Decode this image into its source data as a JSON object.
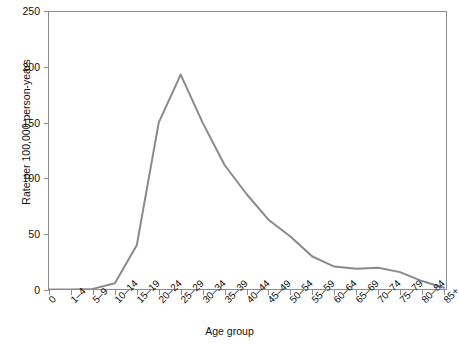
{
  "chart_data": {
    "type": "line",
    "title": "",
    "xlabel": "Age group",
    "ylabel": "Rate per 100,000 person-years",
    "categories": [
      "0",
      "1–4",
      "5–9",
      "10–14",
      "15–19",
      "20–24",
      "25–29",
      "30–34",
      "35–39",
      "40–44",
      "45–49",
      "50–54",
      "55–59",
      "60–64",
      "65–69",
      "70–74",
      "75–79",
      "80–84",
      "85+"
    ],
    "values": [
      0.5,
      0.5,
      1,
      6,
      40,
      150,
      193,
      150,
      112,
      86,
      63,
      48,
      30,
      21,
      19,
      20,
      16,
      8,
      2
    ],
    "series": [
      {
        "name": "Rate",
        "color": "#8a8a8a",
        "values": [
          0.5,
          0.5,
          1,
          6,
          40,
          150,
          193,
          150,
          112,
          86,
          63,
          48,
          30,
          21,
          19,
          20,
          16,
          8,
          2
        ]
      }
    ],
    "ylim": [
      0,
      250
    ],
    "yticks": [
      0,
      50,
      100,
      150,
      200,
      250
    ],
    "ytick_labels": [
      "0",
      "50",
      "100",
      "150",
      "200",
      "250"
    ],
    "grid": false,
    "legend": "none",
    "line_color": "#8a8a8a",
    "line_width": 2,
    "axis_color": "#8d8d8d",
    "background": "#ffffff"
  },
  "axes": {
    "y_title": "Rate per 100,000 person-years",
    "x_title": "Age group"
  }
}
